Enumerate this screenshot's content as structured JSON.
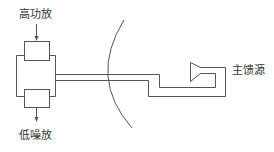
{
  "diagram": {
    "labels": {
      "hpa": "高功放",
      "lna": "低噪放",
      "main_feed": "主馈源"
    },
    "colors": {
      "line": "#555555",
      "text": "#333333",
      "background": "#ffffff"
    }
  }
}
